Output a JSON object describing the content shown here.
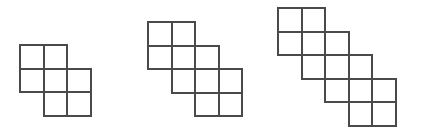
{
  "image": {
    "title": "Growing staircase polyomino pattern",
    "background_color": "#ffffff",
    "width": 421,
    "height": 138
  },
  "style": {
    "stroke_color": "#4a4a4a",
    "stroke_width": 2,
    "cell_size": 23.5,
    "fill_color": "none"
  },
  "figures": [
    {
      "name": "figure-1",
      "label": "Figure 1",
      "origin_x": 20,
      "origin_y": 45,
      "steps": 2,
      "square_count": 7,
      "rows": 3,
      "columns": 3,
      "cells": [
        {
          "col": 0,
          "row": 0
        },
        {
          "col": 1,
          "row": 0
        },
        {
          "col": 0,
          "row": 1
        },
        {
          "col": 1,
          "row": 1
        },
        {
          "col": 2,
          "row": 1
        },
        {
          "col": 1,
          "row": 2
        },
        {
          "col": 2,
          "row": 2
        }
      ]
    },
    {
      "name": "figure-2",
      "label": "Figure 2",
      "origin_x": 148,
      "origin_y": 22,
      "steps": 3,
      "square_count": 10,
      "rows": 4,
      "columns": 4,
      "cells": [
        {
          "col": 0,
          "row": 0
        },
        {
          "col": 1,
          "row": 0
        },
        {
          "col": 0,
          "row": 1
        },
        {
          "col": 1,
          "row": 1
        },
        {
          "col": 2,
          "row": 1
        },
        {
          "col": 1,
          "row": 2
        },
        {
          "col": 2,
          "row": 2
        },
        {
          "col": 3,
          "row": 2
        },
        {
          "col": 2,
          "row": 3
        },
        {
          "col": 3,
          "row": 3
        }
      ]
    },
    {
      "name": "figure-3",
      "label": "Figure 3",
      "origin_x": 278,
      "origin_y": 8,
      "steps": 4,
      "square_count": 13,
      "rows": 5,
      "columns": 5,
      "cells": [
        {
          "col": 0,
          "row": 0
        },
        {
          "col": 1,
          "row": 0
        },
        {
          "col": 0,
          "row": 1
        },
        {
          "col": 1,
          "row": 1
        },
        {
          "col": 2,
          "row": 1
        },
        {
          "col": 1,
          "row": 2
        },
        {
          "col": 2,
          "row": 2
        },
        {
          "col": 3,
          "row": 2
        },
        {
          "col": 2,
          "row": 3
        },
        {
          "col": 3,
          "row": 3
        },
        {
          "col": 4,
          "row": 3
        },
        {
          "col": 3,
          "row": 4
        },
        {
          "col": 4,
          "row": 4
        }
      ]
    }
  ]
}
